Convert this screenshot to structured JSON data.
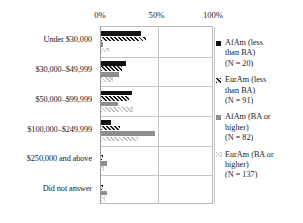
{
  "chart_data": {
    "type": "bar",
    "orientation": "horizontal",
    "title": "",
    "xlabel": "",
    "ylabel": "",
    "xlim": [
      0,
      100
    ],
    "xticks": [
      "0%",
      "50%",
      "100%"
    ],
    "xtick_values": [
      0,
      50,
      100
    ],
    "grid": true,
    "legend_position": "right",
    "categories": [
      "Under $30,000",
      "$30,000–$49,999",
      "$50,000–$99,999",
      "$100,000–$249,999",
      "$250,000 and above",
      "Did not answer"
    ],
    "series": [
      {
        "name": "AfAm (less than BA)",
        "n_label": "(N = 20)",
        "legend_lines": [
          "AfAm (less",
          "than BA)",
          "(N = 20)"
        ],
        "pattern": "solid-black",
        "color": "#121212",
        "values": [
          35,
          22,
          27,
          9,
          0,
          0
        ]
      },
      {
        "name": "EurAm (less than BA)",
        "n_label": "(N = 91)",
        "legend_lines": [
          "EurAm (less",
          "than BA)",
          "(N = 91)"
        ],
        "pattern": "diagonal-hatch-dark",
        "color": "#1b1b1b",
        "values": [
          40,
          19,
          25,
          17,
          2,
          2
        ]
      },
      {
        "name": "AfAm (BA or higher)",
        "n_label": "(N = 82)",
        "legend_lines": [
          "AfAm (BA or",
          "higher)",
          "(N = 82)"
        ],
        "pattern": "solid-gray",
        "color": "#8e8e8e",
        "values": [
          2,
          16,
          15,
          48,
          5,
          5
        ]
      },
      {
        "name": "EurAm (BA or higher)",
        "n_label": "(N = 137)",
        "legend_lines": [
          "EurAm (BA or",
          "higher)",
          "(N = 137)"
        ],
        "pattern": "diagonal-hatch-light",
        "color": "#bdbdbd",
        "values": [
          6,
          10,
          27,
          32,
          2,
          3
        ]
      }
    ]
  }
}
